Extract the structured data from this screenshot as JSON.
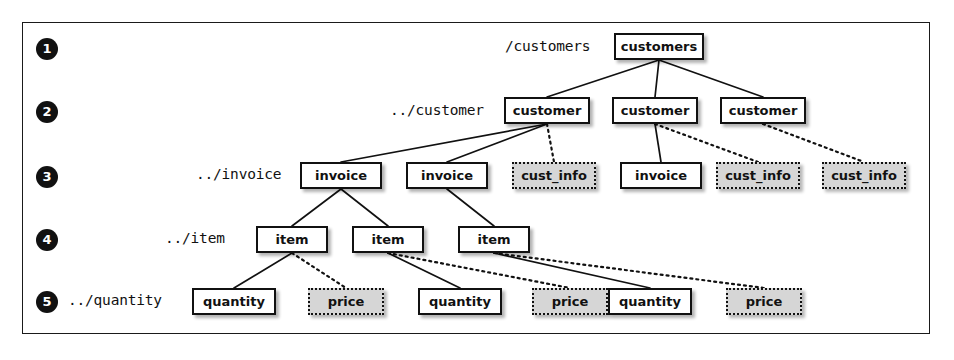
{
  "figure": {
    "frame_color": "#1a1a1a",
    "node_solid_fill": "#ffffff",
    "node_dotted_fill": "#d6d6d6",
    "ink_color": "#111111"
  },
  "rows": [
    {
      "bullet": "1",
      "path_label": "/customers",
      "level": 1
    },
    {
      "bullet": "2",
      "path_label": "../customer",
      "level": 2
    },
    {
      "bullet": "3",
      "path_label": "../invoice",
      "level": 3
    },
    {
      "bullet": "4",
      "path_label": "../item",
      "level": 4
    },
    {
      "bullet": "5",
      "path_label": "../quantity",
      "level": 5
    }
  ],
  "nodes": [
    {
      "id": "customers",
      "label": "customers",
      "style": "solid",
      "row": 1,
      "x": 614,
      "y": 33,
      "w": 90
    },
    {
      "id": "customer1",
      "label": "customer",
      "style": "solid",
      "row": 2,
      "x": 504,
      "y": 97,
      "w": 86
    },
    {
      "id": "customer2",
      "label": "customer",
      "style": "solid",
      "row": 2,
      "x": 612,
      "y": 97,
      "w": 86
    },
    {
      "id": "customer3",
      "label": "customer",
      "style": "solid",
      "row": 2,
      "x": 720,
      "y": 97,
      "w": 86
    },
    {
      "id": "invoice1",
      "label": "invoice",
      "style": "solid",
      "row": 3,
      "x": 300,
      "y": 162,
      "w": 82
    },
    {
      "id": "invoice2",
      "label": "invoice",
      "style": "solid",
      "row": 3,
      "x": 406,
      "y": 162,
      "w": 82
    },
    {
      "id": "custinfo1",
      "label": "cust_info",
      "style": "dotted",
      "row": 3,
      "x": 512,
      "y": 162,
      "w": 84
    },
    {
      "id": "invoice3",
      "label": "invoice",
      "style": "solid",
      "row": 3,
      "x": 620,
      "y": 162,
      "w": 82
    },
    {
      "id": "custinfo2",
      "label": "cust_info",
      "style": "dotted",
      "row": 3,
      "x": 716,
      "y": 162,
      "w": 84
    },
    {
      "id": "custinfo3",
      "label": "cust_info",
      "style": "dotted",
      "row": 3,
      "x": 822,
      "y": 162,
      "w": 84
    },
    {
      "id": "item1",
      "label": "item",
      "style": "solid",
      "row": 4,
      "x": 256,
      "y": 226,
      "w": 72
    },
    {
      "id": "item2",
      "label": "item",
      "style": "solid",
      "row": 4,
      "x": 352,
      "y": 226,
      "w": 72
    },
    {
      "id": "item3",
      "label": "item",
      "style": "solid",
      "row": 4,
      "x": 458,
      "y": 226,
      "w": 72
    },
    {
      "id": "quantity1",
      "label": "quantity",
      "style": "solid",
      "row": 5,
      "x": 192,
      "y": 288,
      "w": 84
    },
    {
      "id": "price1",
      "label": "price",
      "style": "dotted",
      "row": 5,
      "x": 308,
      "y": 288,
      "w": 76
    },
    {
      "id": "quantity2",
      "label": "quantity",
      "style": "solid",
      "row": 5,
      "x": 418,
      "y": 288,
      "w": 84
    },
    {
      "id": "price2",
      "label": "price",
      "style": "dotted",
      "row": 5,
      "x": 532,
      "y": 288,
      "w": 76
    },
    {
      "id": "quantity3",
      "label": "quantity",
      "style": "solid",
      "row": 5,
      "x": 608,
      "y": 288,
      "w": 84
    },
    {
      "id": "price3",
      "label": "price",
      "style": "dotted",
      "row": 5,
      "x": 726,
      "y": 288,
      "w": 76
    }
  ],
  "edges": [
    {
      "from": "customers",
      "to": "customer1",
      "style": "solid"
    },
    {
      "from": "customers",
      "to": "customer2",
      "style": "solid"
    },
    {
      "from": "customers",
      "to": "customer3",
      "style": "solid"
    },
    {
      "from": "customer1",
      "to": "invoice1",
      "style": "solid"
    },
    {
      "from": "customer1",
      "to": "invoice2",
      "style": "solid"
    },
    {
      "from": "customer1",
      "to": "custinfo1",
      "style": "dotted"
    },
    {
      "from": "customer2",
      "to": "invoice3",
      "style": "solid"
    },
    {
      "from": "customer2",
      "to": "custinfo2",
      "style": "dotted"
    },
    {
      "from": "customer3",
      "to": "custinfo3",
      "style": "dotted"
    },
    {
      "from": "invoice1",
      "to": "item1",
      "style": "solid"
    },
    {
      "from": "invoice1",
      "to": "item2",
      "style": "solid"
    },
    {
      "from": "invoice2",
      "to": "item3",
      "style": "solid"
    },
    {
      "from": "item1",
      "to": "quantity1",
      "style": "solid"
    },
    {
      "from": "item1",
      "to": "price1",
      "style": "dotted"
    },
    {
      "from": "item2",
      "to": "quantity2",
      "style": "solid"
    },
    {
      "from": "item2",
      "to": "price2",
      "style": "dotted"
    },
    {
      "from": "item3",
      "to": "quantity3",
      "style": "solid"
    },
    {
      "from": "item3",
      "to": "price3",
      "style": "dotted"
    }
  ],
  "bullet_positions": [
    {
      "x": 36,
      "y": 38
    },
    {
      "x": 36,
      "y": 101
    },
    {
      "x": 36,
      "y": 166
    },
    {
      "x": 36,
      "y": 229
    },
    {
      "x": 36,
      "y": 291
    }
  ],
  "label_positions": [
    {
      "x": 505,
      "y": 38
    },
    {
      "x": 390,
      "y": 102
    },
    {
      "x": 196,
      "y": 166
    },
    {
      "x": 165,
      "y": 230
    },
    {
      "x": 68,
      "y": 292
    }
  ]
}
